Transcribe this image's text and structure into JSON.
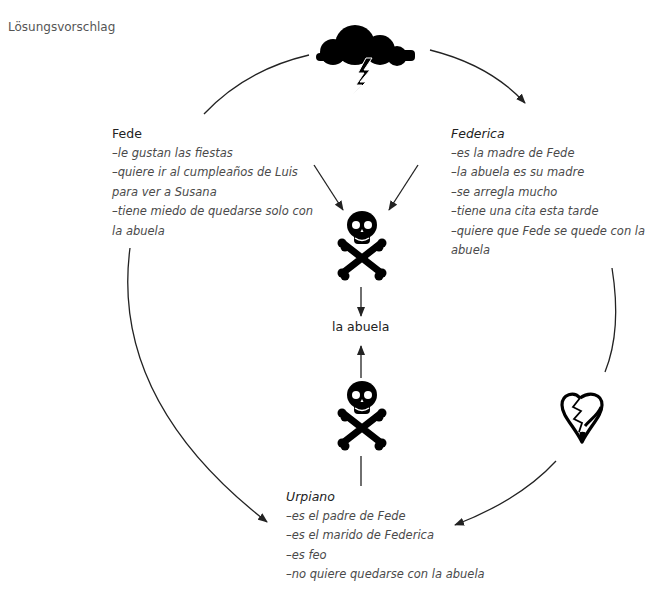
{
  "page_label": "Lösungsvorschlag",
  "icons": {
    "top": "storm-cloud-lightning-icon",
    "center_upper": "skull-crossbones-icon",
    "center_lower": "skull-crossbones-icon",
    "right": "broken-heart-icon"
  },
  "center": {
    "label": "la abuela"
  },
  "characters": {
    "fede": {
      "name": "Fede",
      "lines": [
        "–le gustan las fiestas",
        "–quiere ir al cumpleaños de Luis",
        "para ver a Susana",
        "–tiene miedo de quedarse solo con",
        "la abuela"
      ]
    },
    "federica": {
      "name": "Federica",
      "lines": [
        "–es la madre de Fede",
        "–la abuela es su madre",
        "–se arregla mucho",
        "–tiene una cita esta tarde",
        "–quiere que Fede se quede con la",
        "abuela"
      ]
    },
    "urpiano": {
      "name": "Urpiano",
      "lines": [
        "–es el padre de Fede",
        "–es el marido de Federica",
        "–es feo",
        "–no quiere quedarse con la abuela"
      ]
    }
  },
  "colors": {
    "line": "#222222",
    "text": "#4a4a4a",
    "icon": "#000000"
  }
}
